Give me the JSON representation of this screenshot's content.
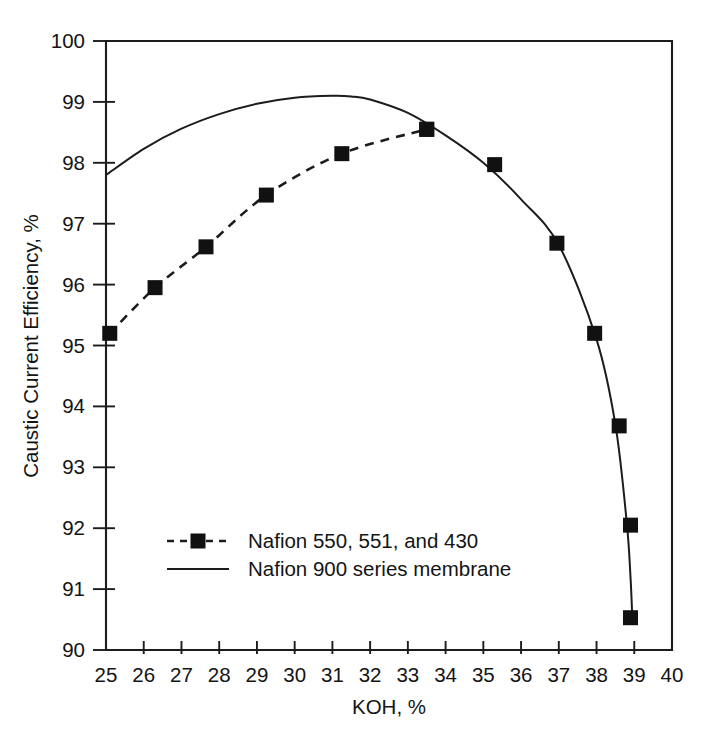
{
  "chart_data": {
    "type": "line",
    "title": "",
    "xlabel": "KOH, %",
    "ylabel": "Caustic Current Efficiency, %",
    "xlim": [
      25,
      40
    ],
    "ylim": [
      90,
      100
    ],
    "xticks": [
      25,
      26,
      27,
      28,
      29,
      30,
      31,
      32,
      33,
      34,
      35,
      36,
      37,
      38,
      39,
      40
    ],
    "yticks": [
      90,
      91,
      92,
      93,
      94,
      95,
      96,
      97,
      98,
      99,
      100
    ],
    "xtick_labels": [
      "25",
      "26",
      "27",
      "28",
      "29",
      "30",
      "31",
      "32",
      "33",
      "34",
      "35",
      "36",
      "37",
      "38",
      "39",
      "40"
    ],
    "ytick_labels": [
      "90",
      "91",
      "92",
      "93",
      "94",
      "95",
      "96",
      "97",
      "98",
      "99",
      "100"
    ],
    "grid": false,
    "legend_position": "lower-left-inside",
    "series": [
      {
        "name": "Nafion 550, 551, and 430",
        "style": "dashed",
        "marker": "filled-square",
        "x": [
          25.1,
          26.3,
          27.65,
          29.25,
          31.25,
          33.5
        ],
        "y": [
          95.2,
          95.95,
          96.62,
          97.47,
          98.15,
          98.55
        ]
      },
      {
        "name": "Nafion 900 series membrane",
        "style": "solid",
        "marker": "filled-square",
        "x": [
          33.5,
          35.3,
          36.95,
          37.95,
          38.6,
          38.9
        ],
        "y": [
          98.55,
          97.97,
          96.68,
          95.2,
          93.68,
          92.05
        ],
        "curve_x": [
          25.0,
          26.0,
          27.0,
          28.0,
          29.0,
          30.0,
          31.0,
          31.5,
          32.0,
          33.0,
          34.0,
          35.0,
          36.0,
          37.0,
          38.0,
          38.5,
          38.8,
          38.9,
          38.95
        ],
        "curve_y": [
          97.8,
          98.23,
          98.56,
          98.8,
          98.97,
          99.07,
          99.1,
          99.09,
          99.04,
          98.82,
          98.45,
          98.0,
          97.4,
          96.65,
          95.1,
          93.7,
          92.1,
          91.2,
          90.5
        ],
        "extra_markers_x": [
          38.9
        ],
        "extra_markers_y": [
          90.53
        ]
      }
    ],
    "legend": [
      {
        "label": "Nafion 550, 551, and 430",
        "style": "dashed",
        "marker": "filled-square"
      },
      {
        "label": "Nafion 900 series membrane",
        "style": "solid",
        "marker": "none"
      }
    ],
    "colors": {
      "line": "#1c1c1c",
      "marker": "#111111",
      "axis": "#1c1c1c",
      "background": "#ffffff"
    }
  }
}
